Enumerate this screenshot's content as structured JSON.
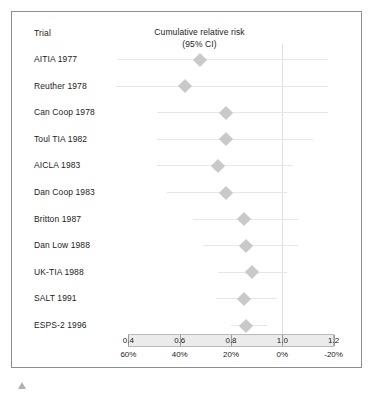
{
  "figure": {
    "column_header": "Trial",
    "title_line1": "Cumulative relative risk",
    "title_line2": "(95% CI)",
    "caret_icon": "triangle-up-icon"
  },
  "chart_data": {
    "type": "forest",
    "title": "Cumulative relative risk (95% CI)",
    "xlabel": "",
    "ylabel": "Trial",
    "xlim": [
      0.34,
      1.26
    ],
    "grid": false,
    "reference_line": 1.0,
    "axis_primary": {
      "name": "Cumulative relative risk",
      "ticks": [
        0.4,
        0.6,
        0.8,
        1.0,
        1.2
      ],
      "tick_labels": [
        "0.4",
        "0.6",
        "0.8",
        "1.0",
        "1.2"
      ]
    },
    "axis_secondary": {
      "name": "Relative risk reduction",
      "ticks": [
        0.4,
        0.6,
        0.8,
        1.0,
        1.2
      ],
      "tick_labels": [
        "60%",
        "40%",
        "20%",
        "0%",
        "-20%"
      ]
    },
    "categories": [
      "AITIA 1977",
      "Reuther 1978",
      "Can Coop 1978",
      "Toul TIA 1982",
      "AICLA 1983",
      "Dan Coop 1983",
      "Britton 1987",
      "Dan Low 1988",
      "UK-TIA 1988",
      "SALT 1991",
      "ESPS-2 1996"
    ],
    "points": [
      {
        "trial": "AITIA 1977",
        "estimate": 0.68,
        "ci_low": 0.36,
        "ci_high": 1.18
      },
      {
        "trial": "Reuther 1978",
        "estimate": 0.62,
        "ci_low": 0.35,
        "ci_high": 1.18
      },
      {
        "trial": "Can Coop 1978",
        "estimate": 0.78,
        "ci_low": 0.51,
        "ci_high": 1.18
      },
      {
        "trial": "Toul TIA 1982",
        "estimate": 0.78,
        "ci_low": 0.51,
        "ci_high": 1.12
      },
      {
        "trial": "AICLA 1983",
        "estimate": 0.75,
        "ci_low": 0.51,
        "ci_high": 1.04
      },
      {
        "trial": "Dan Coop 1983",
        "estimate": 0.78,
        "ci_low": 0.55,
        "ci_high": 1.02
      },
      {
        "trial": "Britton 1987",
        "estimate": 0.85,
        "ci_low": 0.65,
        "ci_high": 1.06
      },
      {
        "trial": "Dan Low 1988",
        "estimate": 0.86,
        "ci_low": 0.69,
        "ci_high": 1.06
      },
      {
        "trial": "UK-TIA 1988",
        "estimate": 0.88,
        "ci_low": 0.75,
        "ci_high": 1.02
      },
      {
        "trial": "SALT 1991",
        "estimate": 0.85,
        "ci_low": 0.74,
        "ci_high": 0.98
      },
      {
        "trial": "ESPS-2 1996",
        "estimate": 0.86,
        "ci_low": 0.8,
        "ci_high": 0.94
      }
    ]
  }
}
